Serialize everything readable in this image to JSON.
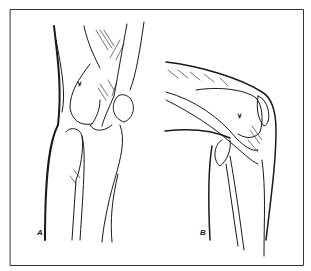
{
  "figure": {
    "panels": [
      {
        "label": "A",
        "view": "anterior/oblique knee"
      },
      {
        "label": "B",
        "view": "lateral flexed knee"
      }
    ],
    "colors": {
      "ink": "#1a1a1a",
      "background": "#ffffff",
      "frame": "#333333"
    }
  }
}
